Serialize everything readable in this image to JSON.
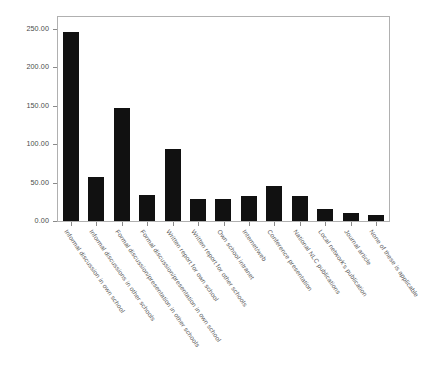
{
  "chart_data": {
    "type": "bar",
    "title": "",
    "subtitle": "",
    "xlabel": "",
    "ylabel": "",
    "ylim": [
      0,
      265
    ],
    "grid": false,
    "legend": false,
    "bar_color": "#111111",
    "axis_color": "#b0b0b0",
    "categories": [
      "Informal discussion in own school",
      "Informal discussions in other schools",
      "Formal discussion/presentation in other schools",
      "Formal discussion/presentation in own school",
      "Written report for own school",
      "Written report for other schools",
      "Own school intranet",
      "Internet/web",
      "Conference presentation",
      "National NLC publications",
      "Local network's publication",
      "Journal article",
      "None of these is applicable"
    ],
    "values": [
      245,
      57,
      147,
      34,
      94,
      29,
      28,
      32,
      46,
      32,
      16,
      11,
      8
    ],
    "yticks": [
      0,
      50,
      100,
      150,
      200,
      250
    ],
    "ytick_labels": [
      "0.00",
      "50.00",
      "100.00",
      "150.00",
      "200.00",
      "250.00"
    ]
  }
}
